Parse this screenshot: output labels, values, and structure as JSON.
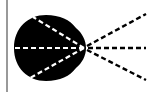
{
  "diagram": {
    "colors": {
      "background": "#ffffff",
      "blob": "#000000",
      "rays_outside": "#000000",
      "rays_inside": "#ffffff",
      "edge_line": "#555555"
    },
    "focal_point": {
      "x": 84,
      "y": 48
    },
    "rays": [
      {
        "name": "upper",
        "end_x": 146,
        "end_y": 14,
        "start_x": 33,
        "start_y": 17
      },
      {
        "name": "middle",
        "end_x": 146,
        "end_y": 48,
        "start_x": 13,
        "start_y": 48
      },
      {
        "name": "lower",
        "end_x": 146,
        "end_y": 80,
        "start_x": 30,
        "start_y": 78
      }
    ]
  }
}
